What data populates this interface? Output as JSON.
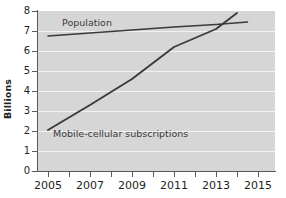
{
  "chart_data": {
    "type": "line",
    "title": "",
    "xlabel": "",
    "ylabel": "Billions",
    "xlim": [
      2004.6,
      2015.6
    ],
    "ylim": [
      0,
      8
    ],
    "yticks": [
      0,
      1,
      2,
      3,
      4,
      5,
      6,
      7,
      8
    ],
    "ytick_labels": [
      "0",
      "1",
      "2",
      "3",
      "4",
      "5",
      "6",
      "7",
      "8"
    ],
    "xticks": [
      2005,
      2006,
      2007,
      2008,
      2009,
      2010,
      2011,
      2012,
      2013,
      2014,
      2015
    ],
    "xtick_labels": [
      "2005",
      "",
      "2007",
      "",
      "2009",
      "",
      "2011",
      "",
      "2013",
      "",
      "2015"
    ],
    "xtick_labels_shown": [
      "2005",
      "2007",
      "2009",
      "2011",
      "2013",
      "2015"
    ],
    "grid": "horizontal",
    "legend": "inline-annotations",
    "plot_background": "#d6d6d6",
    "gridline_color": "#f2f2f2",
    "line_color": "#3a3a3a",
    "series": [
      {
        "name": "Population",
        "x": [
          2005,
          2007,
          2009,
          2011,
          2013,
          2014.5
        ],
        "values": [
          6.75,
          6.9,
          7.05,
          7.2,
          7.33,
          7.45
        ]
      },
      {
        "name": "Mobile-cellular subscriptions",
        "x": [
          2005,
          2007,
          2009,
          2011,
          2013,
          2014
        ],
        "values": [
          2.05,
          3.3,
          4.6,
          6.2,
          7.1,
          7.9
        ]
      }
    ],
    "annotations": [
      {
        "text": "Population",
        "x": 2006.2,
        "y": 7.55
      },
      {
        "text": "Mobile-cellular subscriptions",
        "x": 2005.8,
        "y": 2.1
      }
    ]
  },
  "axis": {
    "y_title": "Billions"
  }
}
